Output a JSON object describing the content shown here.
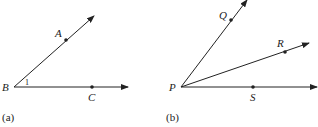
{
  "figures": [
    {
      "caption": "(a)",
      "vertex": {
        "label": "B",
        "x": 14,
        "y": 87
      },
      "rays": [
        {
          "point_label": "A",
          "point": [
            66,
            40
          ],
          "end": [
            94,
            16
          ]
        },
        {
          "point_label": "C",
          "point": [
            92,
            87
          ],
          "end": [
            128,
            87
          ]
        }
      ],
      "angle_label": "1"
    },
    {
      "caption": "(b)",
      "vertex": {
        "label": "P",
        "x": 181,
        "y": 87
      },
      "rays": [
        {
          "point_label": "Q",
          "point": [
            231,
            20
          ],
          "end": [
            247,
            0
          ]
        },
        {
          "point_label": "R",
          "point": [
            285,
            52
          ],
          "end": [
            309,
            43
          ]
        },
        {
          "point_label": "S",
          "point": [
            253,
            87
          ],
          "end": [
            317,
            87
          ]
        }
      ]
    }
  ],
  "colors": {
    "stroke": "#222222"
  }
}
